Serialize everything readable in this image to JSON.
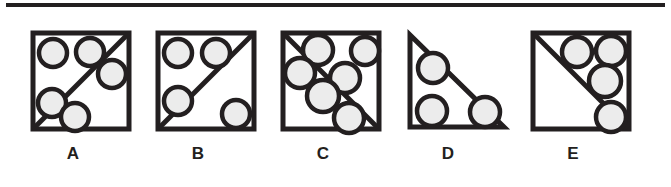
{
  "figure_panel": {
    "name": "multiple-choice-figure-row",
    "top_rule": true,
    "colors": {
      "stroke": "#231f20",
      "circle_fill": "#ececec",
      "background": "#ffffff"
    },
    "options": [
      {
        "label": "A",
        "shape": "square",
        "diagonal": "bottom-left-to-top-right",
        "circle_count": 4,
        "circles": [
          {
            "cx": 20,
            "cy": 20,
            "r": 14
          },
          {
            "cx": 57,
            "cy": 19,
            "r": 14
          },
          {
            "cx": 79,
            "cy": 41,
            "r": 14
          },
          {
            "cx": 19,
            "cy": 70,
            "r": 14
          },
          {
            "cx": 42,
            "cy": 84,
            "r": 14
          }
        ]
      },
      {
        "label": "B",
        "shape": "square",
        "diagonal": "bottom-left-to-top-right",
        "circle_count": 4,
        "circles": [
          {
            "cx": 20,
            "cy": 20,
            "r": 14
          },
          {
            "cx": 58,
            "cy": 20,
            "r": 14
          },
          {
            "cx": 20,
            "cy": 68,
            "r": 14
          },
          {
            "cx": 78,
            "cy": 81,
            "r": 14
          }
        ]
      },
      {
        "label": "C",
        "shape": "square",
        "diagonal": "top-left-to-bottom-right",
        "circle_count": 6,
        "circles": [
          {
            "cx": 35,
            "cy": 17,
            "r": 15
          },
          {
            "cx": 82,
            "cy": 18,
            "r": 14
          },
          {
            "cx": 17,
            "cy": 40,
            "r": 15
          },
          {
            "cx": 62,
            "cy": 45,
            "r": 15
          },
          {
            "cx": 40,
            "cy": 63,
            "r": 16
          },
          {
            "cx": 66,
            "cy": 85,
            "r": 15
          }
        ]
      },
      {
        "label": "D",
        "shape": "right-triangle",
        "diagonal": "hypotenuse-top-left-to-bottom-right",
        "circle_count": 3,
        "circles": [
          {
            "cx": 25,
            "cy": 35,
            "r": 15
          },
          {
            "cx": 24,
            "cy": 78,
            "r": 15
          },
          {
            "cx": 77,
            "cy": 79,
            "r": 15
          }
        ]
      },
      {
        "label": "E",
        "shape": "square",
        "diagonal": "top-left-to-bottom-right",
        "circle_count": 4,
        "circles": [
          {
            "cx": 44,
            "cy": 19,
            "r": 15
          },
          {
            "cx": 78,
            "cy": 18,
            "r": 15
          },
          {
            "cx": 72,
            "cy": 48,
            "r": 16
          },
          {
            "cx": 78,
            "cy": 84,
            "r": 15
          }
        ]
      }
    ]
  }
}
